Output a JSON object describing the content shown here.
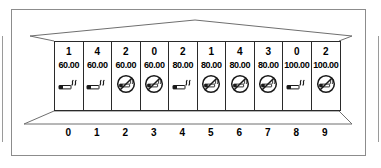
{
  "figure": {
    "colors": {
      "frame_border": "#8c8c8c",
      "cell_border": "#2a2a2a",
      "perspective_line": "#6f6f6f",
      "text": "#000000",
      "background": "#ffffff"
    },
    "cells": [
      {
        "index": "0",
        "count": "1",
        "value": "60.00",
        "icon": "smoking-allowed-icon",
        "icon_label": "smoking"
      },
      {
        "index": "1",
        "count": "4",
        "value": "60.00",
        "icon": "smoking-allowed-icon",
        "icon_label": "smoking"
      },
      {
        "index": "2",
        "count": "2",
        "value": "60.00",
        "icon": "no-smoking-icon",
        "icon_label": "no smoking"
      },
      {
        "index": "3",
        "count": "0",
        "value": "60.00",
        "icon": "no-smoking-icon",
        "icon_label": "no smoking"
      },
      {
        "index": "4",
        "count": "2",
        "value": "80.00",
        "icon": "smoking-allowed-icon",
        "icon_label": "smoking"
      },
      {
        "index": "5",
        "count": "1",
        "value": "80.00",
        "icon": "no-smoking-icon",
        "icon_label": "no smoking"
      },
      {
        "index": "6",
        "count": "4",
        "value": "80.00",
        "icon": "no-smoking-icon",
        "icon_label": "no smoking"
      },
      {
        "index": "7",
        "count": "3",
        "value": "80.00",
        "icon": "no-smoking-icon",
        "icon_label": "no smoking"
      },
      {
        "index": "8",
        "count": "0",
        "value": "100.00",
        "icon": "smoking-allowed-icon",
        "icon_label": "smoking"
      },
      {
        "index": "9",
        "count": "2",
        "value": "100.00",
        "icon": "no-smoking-icon",
        "icon_label": "no smoking"
      }
    ]
  }
}
